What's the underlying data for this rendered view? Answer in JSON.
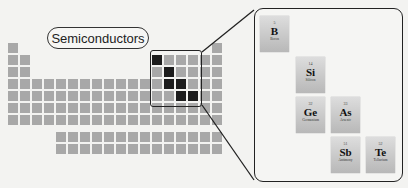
{
  "label": "Semiconductors",
  "grid": {
    "origin_x": 8,
    "pitch": 12,
    "row_y": [
      43,
      55,
      67,
      79,
      91,
      103,
      115
    ],
    "lanth_y": [
      132,
      144
    ]
  },
  "highlighted": [
    {
      "row": 2,
      "col": 13
    },
    {
      "row": 3,
      "col": 14
    },
    {
      "row": 4,
      "col": 14
    },
    {
      "row": 4,
      "col": 15
    },
    {
      "row": 5,
      "col": 15
    },
    {
      "row": 5,
      "col": 16
    }
  ],
  "elements": [
    {
      "number": "5",
      "symbol": "B",
      "name": "Boron",
      "x": 260,
      "y": 16
    },
    {
      "number": "14",
      "symbol": "Si",
      "name": "Silicon",
      "x": 296,
      "y": 57
    },
    {
      "number": "32",
      "symbol": "Ge",
      "name": "Germanium",
      "x": 296,
      "y": 97
    },
    {
      "number": "33",
      "symbol": "As",
      "name": "Arsenic",
      "x": 331,
      "y": 97
    },
    {
      "number": "51",
      "symbol": "Sb",
      "name": "Antimony",
      "x": 331,
      "y": 137
    },
    {
      "number": "52",
      "symbol": "Te",
      "name": "Tellurium",
      "x": 366,
      "y": 137
    }
  ],
  "colors": {
    "cell": "#a8a8a8",
    "highlight": "#1c1c1c",
    "border": "#222222"
  }
}
